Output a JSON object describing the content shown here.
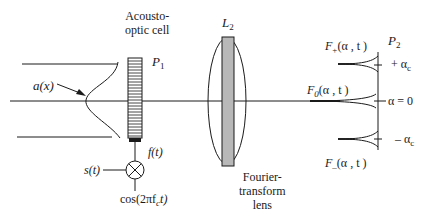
{
  "diagram": {
    "type": "optical-system",
    "components": {
      "input_beam": {
        "label": "a(x)"
      },
      "acousto_optic_cell": {
        "title_line1": "Acousto-",
        "title_line2": "optic cell",
        "plane_label": "P",
        "plane_sub": "1",
        "drive_signal": "f(t)"
      },
      "mixer": {
        "input_signal": "s(t)",
        "carrier": "cos(2πf",
        "carrier_sub": "c",
        "carrier_tail": "t)"
      },
      "lens": {
        "label": "L",
        "label_sub": "2",
        "caption_line1": "Fourier-",
        "caption_line2": "transform",
        "caption_line3": "lens"
      },
      "output_plane": {
        "label": "P",
        "label_sub": "2",
        "spikes": [
          {
            "name": "F",
            "sub": "+",
            "args": "(α , t )",
            "position": "+ α",
            "position_sub": "c"
          },
          {
            "name": "F",
            "sub": "0",
            "args": "(α , t )",
            "position": "α = 0",
            "position_sub": ""
          },
          {
            "name": "F",
            "sub": "–",
            "args": "(α , t )",
            "position": "– α",
            "position_sub": "c"
          }
        ]
      }
    },
    "colors": {
      "line": "#1a1a1a",
      "lens_plate": "#b8b8b8",
      "background": "#ffffff"
    }
  }
}
